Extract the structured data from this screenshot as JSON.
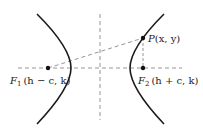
{
  "figure": {
    "type": "hyperbola-horizontal-transverse-axis",
    "colors": {
      "curve": "#1a1a1a",
      "dashed": "#8a8a8a",
      "point": "#111111",
      "text": "#222222"
    },
    "points": {
      "P": {
        "label_name": "P",
        "label_coords": "(x, y)"
      },
      "F1": {
        "label_name": "F",
        "label_sub": "1",
        "label_coords": "(h − c, k)"
      },
      "F2": {
        "label_name": "F",
        "label_sub": "2",
        "label_coords": "(h + c, k)"
      }
    }
  }
}
